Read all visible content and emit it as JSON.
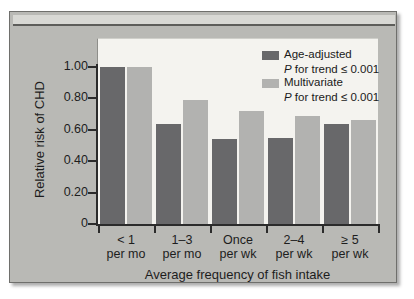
{
  "chart_data": {
    "type": "bar",
    "title": "",
    "xlabel": "Average frequency of fish intake",
    "ylabel": "Relative risk of CHD",
    "categories": [
      "< 1 per mo",
      "1–3 per mo",
      "Once per wk",
      "2–4 per wk",
      "≥ 5 per wk"
    ],
    "category_lines": [
      {
        "line1": "< 1",
        "line2": "per mo"
      },
      {
        "line1": "1–3",
        "line2": "per mo"
      },
      {
        "line1": "Once",
        "line2": "per wk"
      },
      {
        "line1": "2–4",
        "line2": "per wk"
      },
      {
        "line1": "≥ 5",
        "line2": "per wk"
      }
    ],
    "series": [
      {
        "name": "Age-adjusted",
        "color": "#68686a",
        "values": [
          1.0,
          0.64,
          0.54,
          0.55,
          0.64
        ]
      },
      {
        "name": "Multivariate",
        "color": "#b2b2b0",
        "values": [
          1.0,
          0.79,
          0.72,
          0.69,
          0.66
        ]
      }
    ],
    "ylim": [
      0,
      1.08
    ],
    "yticks": [
      "1.00",
      "0.80",
      "0.60",
      "0.40",
      "0.20",
      "0"
    ],
    "ytick_values": [
      1.0,
      0.8,
      0.6,
      0.4,
      0.2,
      0
    ],
    "grid": false,
    "legend_position": "top-right"
  },
  "legend": {
    "entries": [
      {
        "label": "Age-adjusted",
        "p_prefix": "P",
        "p_text": " for trend ≤ 0.001",
        "swatch": "dark"
      },
      {
        "label": "Multivariate",
        "p_prefix": "P",
        "p_text": " for trend ≤ 0.001",
        "swatch": "light"
      }
    ]
  },
  "colors": {
    "age_adjusted": "#68686a",
    "multivariate": "#b2b2b0",
    "frame_background": "#b9b9b5",
    "plot_background": "#f4f3ef",
    "axis": "#2b2b2b"
  }
}
